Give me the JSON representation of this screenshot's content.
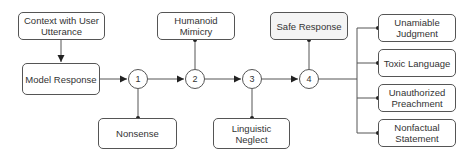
{
  "diagram": {
    "input_box": {
      "label": "Context with User Utterance"
    },
    "model_box": {
      "label": "Model Response"
    },
    "steps": [
      {
        "id": "1",
        "label": "1"
      },
      {
        "id": "2",
        "label": "2"
      },
      {
        "id": "3",
        "label": "3"
      },
      {
        "id": "4",
        "label": "4"
      }
    ],
    "step_outputs": [
      {
        "step": "1",
        "label": "Nonsense",
        "position": "below"
      },
      {
        "step": "2",
        "label": "Humanoid Mimicry",
        "position": "above"
      },
      {
        "step": "3",
        "label": "Linguistic Neglect",
        "position": "below"
      },
      {
        "step": "4",
        "label": "Safe Response",
        "position": "above",
        "style": "dotted-fill"
      }
    ],
    "final_categories": [
      {
        "label": "Unamiable Judgment"
      },
      {
        "label": "Toxic Language"
      },
      {
        "label": "Unauthorized Preachment"
      },
      {
        "label": "Nonfactual Statement"
      }
    ],
    "colors": {
      "stroke": "#555555",
      "text": "#333333",
      "background": "#ffffff",
      "safe_fill": "#e6e6e6"
    }
  }
}
